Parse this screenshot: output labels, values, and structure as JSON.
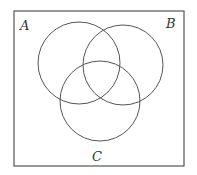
{
  "diagram": {
    "type": "venn",
    "set_count": 3,
    "universe": {
      "x": 14,
      "y": 11,
      "width": 170,
      "height": 155,
      "stroke": "#555555"
    },
    "circles": [
      {
        "id": "A",
        "cx": 79,
        "cy": 63,
        "r": 41,
        "stroke": "#555555"
      },
      {
        "id": "B",
        "cx": 123,
        "cy": 65,
        "r": 40,
        "stroke": "#555555"
      },
      {
        "id": "C",
        "cx": 100,
        "cy": 101,
        "r": 40,
        "stroke": "#555555"
      }
    ],
    "labels": [
      {
        "text": "A",
        "x": 20,
        "y": 30
      },
      {
        "text": "B",
        "x": 166,
        "y": 28
      },
      {
        "text": "C",
        "x": 92,
        "y": 161
      }
    ]
  }
}
